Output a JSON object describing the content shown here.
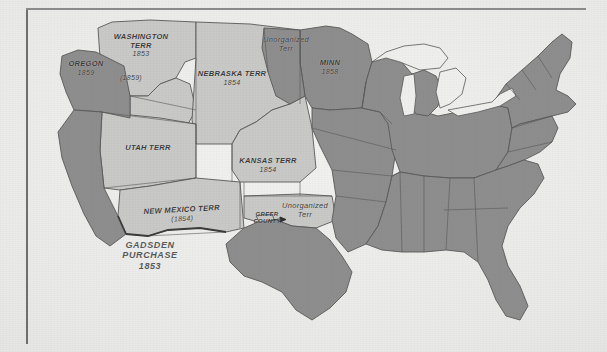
{
  "image": {
    "title": "Map of the United States showing territories, 1853-1859",
    "width": 607,
    "height": 352
  },
  "palette": {
    "paper": "#ecece9",
    "state_fill": "#8e8e8e",
    "territory_fill": "#c9c9c7",
    "water_fill": "#eeeeec",
    "border_line": "#5a5a5a",
    "label_text": "#3a3a3a",
    "frame_line": "#6e6e6e"
  },
  "map": {
    "labels": [
      {
        "id": "washington-terr",
        "name": "WASHINGTON TERR",
        "lines": [
          "WASHINGTON",
          "TERR",
          "1853"
        ],
        "date_note": "(1859)",
        "x": 139,
        "y": 40,
        "style": "caps",
        "kind": "territory"
      },
      {
        "id": "washington-terr-note",
        "name": "(1859)",
        "lines": [
          "(1859)"
        ],
        "x": 130,
        "y": 79,
        "style": "year",
        "kind": "territory"
      },
      {
        "id": "oregon",
        "name": "OREGON",
        "lines": [
          "OREGON",
          "1859"
        ],
        "x": 85,
        "y": 66,
        "style": "caps",
        "kind": "state"
      },
      {
        "id": "nebraska-terr",
        "name": "NEBRASKA TERR",
        "lines": [
          "NEBRASKA TERR",
          "1854"
        ],
        "x": 232,
        "y": 77,
        "style": "caps",
        "kind": "territory"
      },
      {
        "id": "unorganized-terr-north",
        "name": "Unorganized Terr",
        "lines": [
          "Unorganized",
          "Terr"
        ],
        "x": 286,
        "y": 42,
        "style": "mixed",
        "kind": "territory"
      },
      {
        "id": "minnesota",
        "name": "MINN",
        "lines": [
          "MINN",
          "1858"
        ],
        "x": 330,
        "y": 65,
        "style": "caps",
        "kind": "state"
      },
      {
        "id": "utah-terr",
        "name": "UTAH TERR",
        "lines": [
          "UTAH TERR"
        ],
        "x": 148,
        "y": 148,
        "style": "caps",
        "kind": "territory"
      },
      {
        "id": "kansas-terr",
        "name": "KANSAS TERR",
        "lines": [
          "KANSAS TERR",
          "1854"
        ],
        "x": 268,
        "y": 163,
        "style": "caps",
        "kind": "territory"
      },
      {
        "id": "new-mexico-terr",
        "name": "NEW MEXICO TERR",
        "lines": [
          "NEW MEXICO TERR",
          "(1854)"
        ],
        "x": 182,
        "y": 212,
        "style": "caps",
        "kind": "territory"
      },
      {
        "id": "greer-county",
        "name": "GREER COUNTY",
        "lines": [
          "GREER",
          "COUNTY"
        ],
        "x": 267,
        "y": 215,
        "style": "greer",
        "kind": "annotation"
      },
      {
        "id": "unorganized-terr-south",
        "name": "Unorganized Terr",
        "lines": [
          "Unorganized",
          "Terr"
        ],
        "x": 303,
        "y": 208,
        "style": "mixed",
        "kind": "territory"
      },
      {
        "id": "gadsden-purchase",
        "name": "GADSDEN PURCHASE",
        "lines": [
          "GADSDEN",
          "PURCHASE",
          "1853"
        ],
        "x": 148,
        "y": 248,
        "style": "gadsden",
        "kind": "annotation"
      }
    ],
    "legend_note": "Darker shading indicates admitted states; lighter shading indicates organized territories."
  }
}
